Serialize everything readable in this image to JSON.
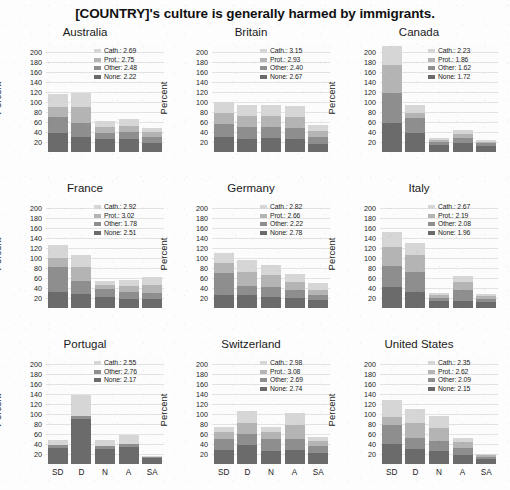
{
  "figure": {
    "title": "[COUNTRY]'s culture is generally harmed by immigrants.",
    "ylabel": "Percent",
    "yticks": [
      200,
      180,
      160,
      140,
      120,
      100,
      80,
      60,
      40,
      20
    ],
    "ylim": [
      0,
      215
    ],
    "xcategories": [
      "SD",
      "D",
      "N",
      "A",
      "SA"
    ]
  },
  "colors": {
    "cath": "#d6d6d6",
    "prot": "#b4b4b4",
    "other": "#8e8e8e",
    "none": "#6b6b6b",
    "grid": "#e3e3e3",
    "text": "#1a1a1a",
    "background": "#fdfdfd"
  },
  "chart_data": {
    "type": "bar",
    "title": "[COUNTRY]'s culture is generally harmed by immigrants.",
    "xlabel": "",
    "ylabel": "Percent",
    "ylim": [
      0,
      215
    ],
    "yticks": [
      20,
      40,
      60,
      80,
      100,
      120,
      140,
      160,
      180,
      200
    ],
    "grid": true,
    "stacked": true,
    "legend_position": "top-right",
    "categories": [
      "SD",
      "D",
      "N",
      "A",
      "SA"
    ],
    "series_order": [
      "None",
      "Other",
      "Prot.",
      "Cath."
    ],
    "panels": [
      {
        "name": "Australia",
        "legend": [
          {
            "label": "Cath.",
            "value": "2.69",
            "color": "#d6d6d6"
          },
          {
            "label": "Prot.",
            "value": "2.75",
            "color": "#b4b4b4"
          },
          {
            "label": "Other",
            "value": "2.48",
            "color": "#8e8e8e"
          },
          {
            "label": "None",
            "value": "2.22",
            "color": "#6b6b6b"
          }
        ],
        "series": [
          {
            "name": "None",
            "values": [
              38,
              30,
              25,
              25,
              18
            ]
          },
          {
            "name": "Other",
            "values": [
              32,
              28,
              12,
              14,
              11
            ]
          },
          {
            "name": "Prot.",
            "values": [
              20,
              32,
              12,
              13,
              10
            ]
          },
          {
            "name": "Cath.",
            "values": [
              25,
              27,
              12,
              13,
              9
            ]
          }
        ]
      },
      {
        "name": "Britain",
        "legend": [
          {
            "label": "Cath.",
            "value": "3.15",
            "color": "#d6d6d6"
          },
          {
            "label": "Prot.",
            "value": "2.93",
            "color": "#b4b4b4"
          },
          {
            "label": "Other",
            "value": "2.40",
            "color": "#8e8e8e"
          },
          {
            "label": "None",
            "value": "2.67",
            "color": "#6b6b6b"
          }
        ],
        "series": [
          {
            "name": "None",
            "values": [
              30,
              26,
              27,
              26,
              16
            ]
          },
          {
            "name": "Other",
            "values": [
              25,
              23,
              23,
              22,
              13
            ]
          },
          {
            "name": "Prot.",
            "values": [
              22,
              22,
              22,
              21,
              12
            ]
          },
          {
            "name": "Cath.",
            "values": [
              23,
              23,
              22,
              22,
              13
            ]
          }
        ]
      },
      {
        "name": "Canada",
        "legend": [
          {
            "label": "Cath.",
            "value": "2.23",
            "color": "#d6d6d6"
          },
          {
            "label": "Prot.",
            "value": "1.86",
            "color": "#b4b4b4"
          },
          {
            "label": "Other",
            "value": "1.62",
            "color": "#8e8e8e"
          },
          {
            "label": "None",
            "value": "1.72",
            "color": "#6b6b6b"
          }
        ],
        "series": [
          {
            "name": "None",
            "values": [
              57,
              38,
              14,
              17,
              12
            ]
          },
          {
            "name": "Other",
            "values": [
              60,
              30,
              5,
              10,
              5
            ]
          },
          {
            "name": "Prot.",
            "values": [
              57,
              10,
              4,
              9,
              3
            ]
          },
          {
            "name": "Cath.",
            "values": [
              38,
              16,
              4,
              8,
              3
            ]
          }
        ]
      },
      {
        "name": "France",
        "legend": [
          {
            "label": "Cath.",
            "value": "2.92",
            "color": "#d6d6d6"
          },
          {
            "label": "Prot.",
            "value": "3.02",
            "color": "#b4b4b4"
          },
          {
            "label": "Other",
            "value": "1.78",
            "color": "#8e8e8e"
          },
          {
            "label": "None",
            "value": "2.51",
            "color": "#6b6b6b"
          }
        ],
        "series": [
          {
            "name": "None",
            "values": [
              32,
              28,
              22,
              18,
              17
            ]
          },
          {
            "name": "Other",
            "values": [
              50,
              25,
              16,
              14,
              12
            ]
          },
          {
            "name": "Prot.",
            "values": [
              18,
              28,
              8,
              12,
              16
            ]
          },
          {
            "name": "Cath.",
            "values": [
              25,
              25,
              8,
              12,
              16
            ]
          }
        ]
      },
      {
        "name": "Germany",
        "legend": [
          {
            "label": "Cath.",
            "value": "2.82",
            "color": "#d6d6d6"
          },
          {
            "label": "Prot.",
            "value": "2.66",
            "color": "#b4b4b4"
          },
          {
            "label": "Other",
            "value": "2.22",
            "color": "#8e8e8e"
          },
          {
            "label": "None",
            "value": "2.78",
            "color": "#6b6b6b"
          }
        ],
        "series": [
          {
            "name": "None",
            "values": [
              25,
              25,
              22,
              20,
              15
            ]
          },
          {
            "name": "Other",
            "values": [
              45,
              18,
              20,
              15,
              10
            ]
          },
          {
            "name": "Prot.",
            "values": [
              20,
              28,
              24,
              16,
              10
            ]
          },
          {
            "name": "Cath.",
            "values": [
              20,
              24,
              20,
              16,
              14
            ]
          }
        ]
      },
      {
        "name": "Italy",
        "legend": [
          {
            "label": "Cath.",
            "value": "2.67",
            "color": "#d6d6d6"
          },
          {
            "label": "Prot.",
            "value": "2.19",
            "color": "#b4b4b4"
          },
          {
            "label": "Other",
            "value": "2.08",
            "color": "#8e8e8e"
          },
          {
            "label": "None",
            "value": "1.96",
            "color": "#6b6b6b"
          }
        ],
        "series": [
          {
            "name": "None",
            "values": [
              42,
              32,
              14,
              14,
              12
            ]
          },
          {
            "name": "Other",
            "values": [
              42,
              40,
              6,
              22,
              6
            ]
          },
          {
            "name": "Prot.",
            "values": [
              38,
              34,
              5,
              16,
              5
            ]
          },
          {
            "name": "Cath.",
            "values": [
              30,
              24,
              5,
              12,
              5
            ]
          }
        ]
      },
      {
        "name": "Portugal",
        "legend": [
          {
            "label": "Cath.",
            "value": "2.55",
            "color": "#d6d6d6"
          },
          {
            "label": "Other",
            "value": "2.76",
            "color": "#8e8e8e"
          },
          {
            "label": "None",
            "value": "2.17",
            "color": "#6b6b6b"
          }
        ],
        "series": [
          {
            "name": "None",
            "values": [
              32,
              90,
              30,
              34,
              12
            ]
          },
          {
            "name": "Other",
            "values": [
              6,
              5,
              6,
              6,
              1
            ]
          },
          {
            "name": "Prot.",
            "values": [
              0,
              0,
              0,
              0,
              0
            ]
          },
          {
            "name": "Cath.",
            "values": [
              10,
              43,
              11,
              17,
              2
            ]
          }
        ]
      },
      {
        "name": "Switzerland",
        "legend": [
          {
            "label": "Cath.",
            "value": "2.98",
            "color": "#d6d6d6"
          },
          {
            "label": "Prot.",
            "value": "3.08",
            "color": "#b4b4b4"
          },
          {
            "label": "Other",
            "value": "2.69",
            "color": "#8e8e8e"
          },
          {
            "label": "None",
            "value": "2.74",
            "color": "#6b6b6b"
          }
        ],
        "series": [
          {
            "name": "None",
            "values": [
              28,
              38,
              25,
              28,
              22
            ]
          },
          {
            "name": "Other",
            "values": [
              22,
              22,
              24,
              22,
              14
            ]
          },
          {
            "name": "Prot.",
            "values": [
              14,
              22,
              14,
              28,
              9
            ]
          },
          {
            "name": "Cath.",
            "values": [
              10,
              24,
              11,
              24,
              8
            ]
          }
        ]
      },
      {
        "name": "United States",
        "legend": [
          {
            "label": "Cath.",
            "value": "2.35",
            "color": "#d6d6d6"
          },
          {
            "label": "Prot.",
            "value": "2.62",
            "color": "#b4b4b4"
          },
          {
            "label": "Other",
            "value": "2.09",
            "color": "#8e8e8e"
          },
          {
            "label": "None",
            "value": "2.15",
            "color": "#6b6b6b"
          }
        ],
        "series": [
          {
            "name": "None",
            "values": [
              40,
              30,
              26,
              18,
              10
            ]
          },
          {
            "name": "Other",
            "values": [
              38,
              22,
              20,
              13,
              4
            ]
          },
          {
            "name": "Prot.",
            "values": [
              16,
              30,
              26,
              12,
              3
            ]
          },
          {
            "name": "Cath.",
            "values": [
              34,
              28,
              24,
              8,
              3
            ]
          }
        ]
      }
    ]
  }
}
